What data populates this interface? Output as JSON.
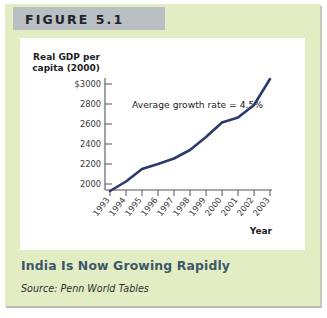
{
  "figure": {
    "band_label": "FIGURE 5.1",
    "caption": "India Is Now Growing Rapidly",
    "source": "Source: Penn World Tables"
  },
  "colors": {
    "panel_green": "#e3edc4",
    "band_gray": "#b9bfc2",
    "caption_blue": "#3c5767",
    "line_navy": "#2e3a6b",
    "axis_gray": "#555555"
  },
  "chart_data": {
    "type": "line",
    "title": "",
    "xlabel": "Year",
    "ylabel": "Real GDP per capita (2000)",
    "ylabel_line1": "Real GDP per",
    "ylabel_line2": "capita (2000)",
    "x": [
      1993,
      1994,
      1995,
      1996,
      1997,
      1998,
      1999,
      2000,
      2001,
      2002,
      2003
    ],
    "categories": [
      "1993",
      "1994",
      "1995",
      "1996",
      "1997",
      "1998",
      "1999",
      "2000",
      "2001",
      "2002",
      "2003"
    ],
    "values": [
      1930,
      2025,
      2150,
      2200,
      2255,
      2340,
      2470,
      2615,
      2665,
      2790,
      3050
    ],
    "ytick_labels": [
      "$3000",
      "2800",
      "2600",
      "2400",
      "2200",
      "2000"
    ],
    "yticks": [
      3000,
      2800,
      2600,
      2400,
      2200,
      2000
    ],
    "ylim": [
      1900,
      3060
    ],
    "xlim": [
      1993,
      2003
    ],
    "grid": false,
    "legend": false,
    "annotations": [
      {
        "text": "Average growth rate = 4.5%"
      }
    ]
  }
}
